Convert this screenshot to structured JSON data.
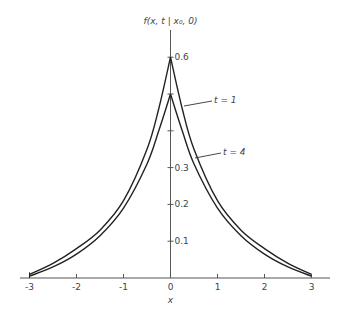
{
  "chart_data": {
    "type": "line",
    "title": "",
    "ylabel": "f(x, t | x₀, 0)",
    "xlabel": "x",
    "xlim": [
      -3,
      3
    ],
    "ylim": [
      0,
      0.6
    ],
    "grid": false,
    "x_ticks": [
      "-3",
      "-2",
      "-1",
      "0",
      "1",
      "2",
      "3"
    ],
    "y_ticks": [
      {
        "value": 0.1,
        "label": "0.1"
      },
      {
        "value": 0.2,
        "label": "0.2"
      },
      {
        "value": 0.3,
        "label": "0.3"
      },
      {
        "value": 0.4,
        "label": ""
      },
      {
        "value": 0.5,
        "label": ""
      },
      {
        "value": 0.6,
        "label": "0.6"
      }
    ],
    "x": [
      -3,
      -2.5,
      -2,
      -1.5,
      -1,
      -0.5,
      -0.25,
      0,
      0.25,
      0.5,
      1,
      1.5,
      2,
      2.5,
      3
    ],
    "series": [
      {
        "name": "t = 1",
        "values": [
          0.01,
          0.04,
          0.08,
          0.13,
          0.21,
          0.35,
          0.46,
          0.6,
          0.46,
          0.35,
          0.21,
          0.13,
          0.08,
          0.04,
          0.01
        ]
      },
      {
        "name": "t = 4",
        "values": [
          0.005,
          0.03,
          0.065,
          0.115,
          0.19,
          0.31,
          0.4,
          0.5,
          0.4,
          0.31,
          0.19,
          0.115,
          0.065,
          0.03,
          0.005
        ]
      }
    ],
    "annotations": [
      {
        "text": "t = 1",
        "points_to_series": 0,
        "at_x": 0.3
      },
      {
        "text": "t = 4",
        "points_to_series": 1,
        "at_x": 0.55
      }
    ],
    "legend": "inline leader-line labels on right side"
  }
}
